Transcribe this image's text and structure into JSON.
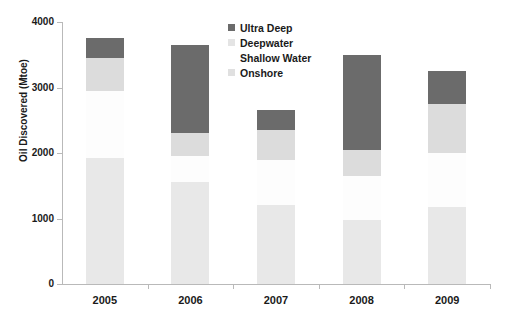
{
  "chart_data": {
    "type": "bar",
    "stacked": true,
    "title": "",
    "xlabel": "",
    "ylabel": "Oil Discovered (Mtoe)",
    "categories": [
      "2005",
      "2006",
      "2007",
      "2008",
      "2009"
    ],
    "ylim": [
      0,
      4000
    ],
    "yticks": [
      "0",
      "1000",
      "2000",
      "3000",
      "4000"
    ],
    "grid": false,
    "legend_position": "top-center",
    "series": [
      {
        "name": "Onshore",
        "color": "#e8e8e8",
        "values": [
          1930,
          1550,
          1200,
          980,
          1180
        ]
      },
      {
        "name": "Shallow Water",
        "color": "#fdfdfd",
        "values": [
          1020,
          400,
          700,
          670,
          820
        ]
      },
      {
        "name": "Deepwater",
        "color": "#dcdcdc",
        "values": [
          500,
          350,
          450,
          400,
          750
        ]
      },
      {
        "name": "Ultra Deep",
        "color": "#6b6b6b",
        "values": [
          300,
          1350,
          300,
          1450,
          500
        ]
      }
    ],
    "totals": [
      3750,
      3650,
      2650,
      3500,
      3250
    ]
  },
  "legend": {
    "items": [
      {
        "label": "Ultra Deep"
      },
      {
        "label": "Deepwater"
      },
      {
        "label": "Shallow Water"
      },
      {
        "label": "Onshore"
      }
    ]
  }
}
